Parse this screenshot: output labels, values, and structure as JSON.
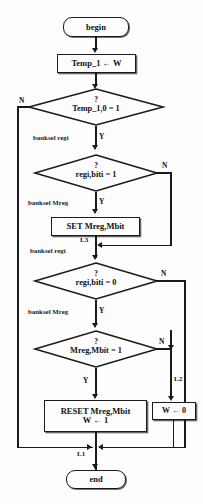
{
  "diagram": {
    "type": "flowchart",
    "title": "",
    "nodes": {
      "begin": {
        "label": "begin",
        "shape": "terminal"
      },
      "temp_assign": {
        "label": "Temp_1 ← W",
        "shape": "process"
      },
      "decision_temp": {
        "question": "?",
        "label": "Temp_1,0 = 1",
        "shape": "decision"
      },
      "decision_regi1": {
        "question": "?",
        "label": "regi,biti = 1",
        "shape": "decision"
      },
      "set_mreg": {
        "label": "SET Mreg,Mbit",
        "shape": "process"
      },
      "decision_regi0": {
        "question": "?",
        "label": "regi,biti = 0",
        "shape": "decision"
      },
      "decision_mreg": {
        "question": "?",
        "label": "Mreg,Mbit = 1",
        "shape": "decision"
      },
      "reset_mreg": {
        "line1": "RESET Mreg,Mbit",
        "line2": "W ← 1",
        "shape": "process"
      },
      "w_zero": {
        "label": "W ← 0",
        "shape": "process"
      },
      "end": {
        "label": "end",
        "shape": "terminal"
      }
    },
    "branch_labels": {
      "n1": "N",
      "y1": "Y",
      "n2": "N",
      "y2": "Y",
      "n3": "N",
      "y3": "Y",
      "n4": "N",
      "y4": "Y"
    },
    "annotations": {
      "banksel_regi_1": "banksel regi",
      "banksel_mreg_1": "banksel Mreg",
      "banksel_regi_2": "banksel regi",
      "banksel_mreg_2": "banksel Mreg"
    },
    "jump_labels": {
      "l3": "L3",
      "l2": "L2",
      "l1": "L1"
    },
    "colors": {
      "stroke": "#1b1b1b",
      "text": "#121212",
      "background": "#fdfdfd"
    }
  }
}
